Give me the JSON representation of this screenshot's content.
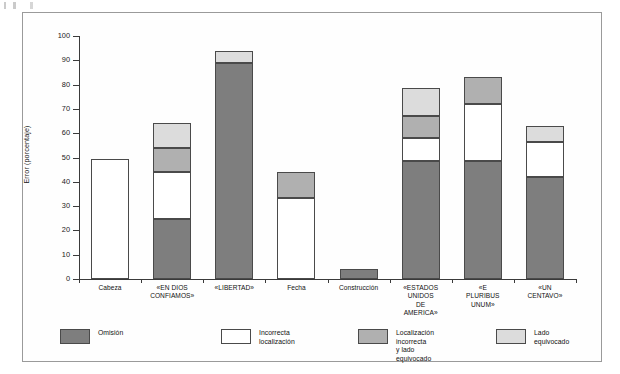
{
  "chart_data": {
    "type": "bar",
    "subtype": "stacked-bar",
    "title": "",
    "xlabel": "",
    "ylabel": "Error (porcentaje)",
    "ylim": [
      0,
      100
    ],
    "ytick_step": 10,
    "yticks": [
      0,
      10,
      20,
      30,
      40,
      50,
      60,
      70,
      80,
      90,
      100
    ],
    "ytick_labels": [
      "0",
      "10",
      "20",
      "30",
      "40",
      "50",
      "60",
      "70",
      "80",
      "90",
      "100"
    ],
    "grid": false,
    "legend_position": "bottom",
    "categories": [
      "Cabeza",
      "«EN DIOS\nCONFIAMOS»",
      "«LIBERTAD»",
      "Fecha",
      "Construcción",
      "«ESTADOS\nUNIDOS\nDE\nAMERICA»",
      "«E\nPLURIBUS\nUNUM»",
      "«UN\nCENTAVO»"
    ],
    "series": [
      {
        "name": "Omisión",
        "color": "#7e7e7e",
        "values": [
          0,
          24.5,
          89,
          0,
          4,
          48.5,
          48.5,
          42
        ]
      },
      {
        "name": "Incorrecta localización",
        "color": "#ffffff",
        "values": [
          49.5,
          19.5,
          0,
          33.5,
          0,
          9.5,
          23.5,
          14.5
        ]
      },
      {
        "name": "Localización incorrecta\ny lado equivocado",
        "color": "#b0b0b0",
        "values": [
          0,
          10,
          0,
          10.5,
          0,
          9,
          11,
          0
        ]
      },
      {
        "name": "Lado equivocado",
        "color": "#dcdcdc",
        "values": [
          0,
          10,
          5,
          0,
          0,
          11.5,
          0,
          6.5
        ]
      }
    ],
    "totals": [
      49.5,
      64,
      94,
      44,
      4,
      78.5,
      83,
      63
    ]
  },
  "legend": {
    "items": [
      {
        "label": "Omisión",
        "color": "#7e7e7e"
      },
      {
        "label": "Incorrecta localización",
        "color": "#ffffff"
      },
      {
        "label": "Localización incorrecta\ny lado equivocado",
        "color": "#b0b0b0"
      },
      {
        "label": "Lado equivocado",
        "color": "#dcdcdc"
      }
    ]
  }
}
